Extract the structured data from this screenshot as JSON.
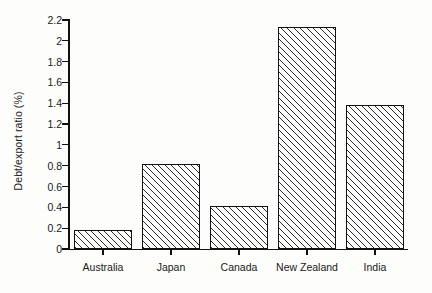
{
  "chart_data": {
    "type": "bar",
    "title": "",
    "xlabel": "",
    "ylabel": "Debt/export ratio (%)",
    "categories": [
      "Australia",
      "Japan",
      "Canada",
      "New Zealand",
      "India"
    ],
    "values": [
      0.18,
      0.82,
      0.41,
      2.13,
      1.38
    ],
    "ylim": [
      0,
      2.2
    ],
    "yticks": [
      "0",
      "0.2",
      "0.4",
      "0.6",
      "0.8",
      "1",
      "1.2",
      "1.4",
      "1.6",
      "1.8",
      "2",
      "2.2"
    ],
    "ytick_values": [
      0,
      0.2,
      0.4,
      0.6,
      0.8,
      1,
      1.2,
      1.4,
      1.6,
      1.8,
      2,
      2.2
    ],
    "grid": false,
    "legend": false,
    "bar_style": {
      "fill": "#ffffff",
      "hatch": "diagonal-45",
      "edge_color": "#111111"
    }
  }
}
